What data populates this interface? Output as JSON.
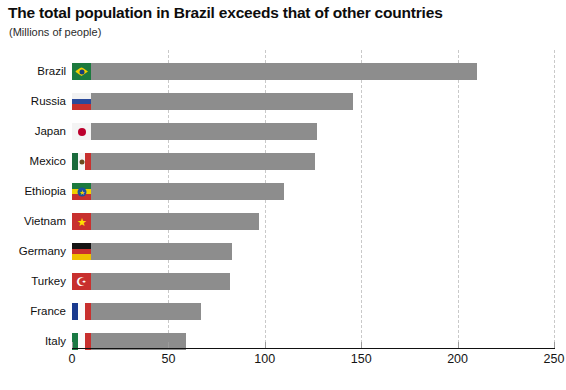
{
  "header": {
    "title": "The total population in Brazil exceeds that of other countries",
    "subtitle": "(Millions of people)"
  },
  "chart_data": {
    "type": "bar",
    "orientation": "horizontal",
    "title": "The total population in Brazil exceeds that of other countries",
    "subtitle": "(Millions of people)",
    "xlabel": "",
    "ylabel": "",
    "unit": "Millions of people",
    "xlim": [
      0,
      250
    ],
    "xticks": [
      "0",
      "50",
      "100",
      "150",
      "200",
      "250"
    ],
    "xtick_values": [
      0,
      50,
      100,
      150,
      200,
      250
    ],
    "grid": "vertical-dashed",
    "legend": "none",
    "bar_color": "#8d8d8d",
    "categories": [
      "Brazil",
      "Russia",
      "Japan",
      "Mexico",
      "Ethiopia",
      "Vietnam",
      "Germany",
      "Turkey",
      "France",
      "Italy"
    ],
    "values": [
      210,
      146,
      127,
      126,
      110,
      97,
      83,
      82,
      67,
      59
    ],
    "series": [
      {
        "name": "Population",
        "values": [
          210,
          146,
          127,
          126,
          110,
          97,
          83,
          82,
          67,
          59
        ]
      }
    ],
    "points": [
      {
        "category": "Brazil",
        "value": 210,
        "flag_icon": "flag-brazil-icon"
      },
      {
        "category": "Russia",
        "value": 146,
        "flag_icon": "flag-russia-icon"
      },
      {
        "category": "Japan",
        "value": 127,
        "flag_icon": "flag-japan-icon"
      },
      {
        "category": "Mexico",
        "value": 126,
        "flag_icon": "flag-mexico-icon"
      },
      {
        "category": "Ethiopia",
        "value": 110,
        "flag_icon": "flag-ethiopia-icon"
      },
      {
        "category": "Vietnam",
        "value": 97,
        "flag_icon": "flag-vietnam-icon"
      },
      {
        "category": "Germany",
        "value": 83,
        "flag_icon": "flag-germany-icon"
      },
      {
        "category": "Turkey",
        "value": 82,
        "flag_icon": "flag-turkey-icon"
      },
      {
        "category": "France",
        "value": 67,
        "flag_icon": "flag-france-icon"
      },
      {
        "category": "Italy",
        "value": 59,
        "flag_icon": "flag-italy-icon"
      }
    ]
  },
  "colors": {
    "bar": "#8d8d8d",
    "grid": "#c9c9c9",
    "axis": "#111111",
    "text": "#101010",
    "background": "#ffffff"
  }
}
